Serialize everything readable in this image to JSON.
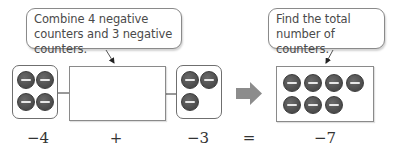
{
  "callouts": {
    "combine": "Combine 4 negative counters and 3 negative counters.",
    "total": "Find the total number of counters."
  },
  "groups": {
    "first": {
      "value": "−4",
      "counters": 4,
      "counter_type": "negative"
    },
    "second": {
      "value": "−3",
      "counters": 3,
      "counter_type": "negative"
    },
    "result": {
      "value": "−7",
      "counters": 7,
      "counter_type": "negative"
    }
  },
  "operators": {
    "plus": "+",
    "equals": "="
  },
  "icons": {
    "counter": "negative-counter-icon",
    "flow_arrow": "right-arrow-icon"
  },
  "colors": {
    "counter_fill": "#555555",
    "counter_mark": "#e8e8e8",
    "flow_arrow": "#8c8c8c",
    "border": "#7a7a7a"
  }
}
